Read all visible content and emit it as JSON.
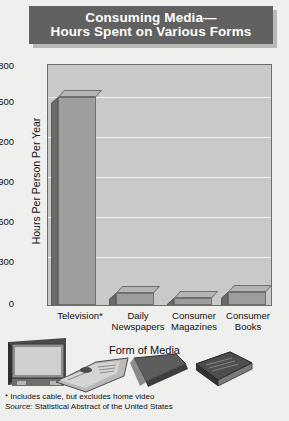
{
  "title": {
    "line1": "Consuming Media—",
    "line2": "Hours Spent on Various Forms"
  },
  "colors": {
    "title_banner": "#616161",
    "title_text": "#ffffff",
    "plot_background": "#c9c9c7",
    "gridline": "#f2f2f0",
    "bar_front": "#9d9d9b",
    "bar_top": "#b4b4b2",
    "bar_side": "#6a6a68",
    "page_background": "#efefed"
  },
  "chart_data": {
    "type": "bar",
    "categories": [
      "Television*",
      "Daily Newspapers",
      "Consumer Magazines",
      "Consumer Books"
    ],
    "category_lines": [
      [
        "Television*",
        ""
      ],
      [
        "Daily",
        "Newspapers"
      ],
      [
        "Consumer",
        "Magazines"
      ],
      [
        "Consumer",
        "Books"
      ]
    ],
    "values": [
      1560,
      90,
      50,
      95
    ],
    "xlabel": "Form of Media",
    "ylabel": "Hours Per Person Per Year",
    "ylim": [
      0,
      1800
    ],
    "yticks": [
      0,
      300,
      600,
      900,
      1200,
      1500,
      1800
    ],
    "ytick_labels": [
      "0",
      "300",
      "600",
      "900",
      "1200",
      "1500",
      "1800"
    ],
    "grid": true,
    "legend": "none",
    "three_d": true
  },
  "notes": {
    "footnote": "* Includes cable, but excludes home video",
    "source_label": "Source:",
    "source_text": " Statistical Abstract of the United States"
  },
  "illustrations": [
    {
      "name": "television-illustration",
      "label": "Television set"
    },
    {
      "name": "newspaper-illustration",
      "label": "Folded newspaper"
    },
    {
      "name": "magazine-illustration",
      "label": "Magazine"
    },
    {
      "name": "book-illustration",
      "label": "Hardcover book"
    }
  ]
}
